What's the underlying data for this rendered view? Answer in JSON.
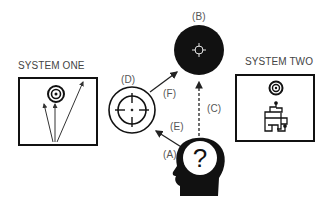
{
  "system_one": {
    "title": "SYSTEM ONE"
  },
  "system_two": {
    "title": "SYSTEM TWO"
  },
  "labels": {
    "a": "(A)",
    "b": "(B)",
    "c": "(C)",
    "d": "(D)",
    "e": "(E)",
    "f": "(F)"
  },
  "head": {
    "symbol": "?"
  },
  "colors": {
    "ink": "#111111",
    "text": "#555555",
    "background": "#ffffff"
  }
}
